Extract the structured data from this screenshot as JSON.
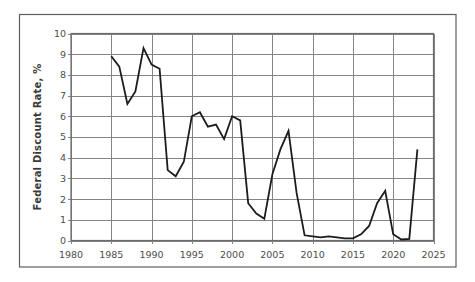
{
  "figure": {
    "background": "#ffffff",
    "outer_border_color": "#5f5f5f",
    "plot_border_color": "#6b6b6b"
  },
  "chart_data": {
    "type": "line",
    "title": "",
    "xlabel": "",
    "ylabel": "Federal Discount Rate, %",
    "xlim": [
      1980,
      2025
    ],
    "ylim": [
      0,
      10
    ],
    "x_ticks": [
      1980,
      1985,
      1990,
      1995,
      2000,
      2005,
      2010,
      2015,
      2020,
      2025
    ],
    "y_ticks": [
      0,
      1,
      2,
      3,
      4,
      5,
      6,
      7,
      8,
      9,
      10
    ],
    "grid": true,
    "legend_position": "none",
    "line_color": "#1c1c1c",
    "grid_color": "#858585",
    "tick_label_color": "#4d4d4d",
    "axis_title_color": "#3a3a3a",
    "series": [
      {
        "name": "Federal Discount Rate",
        "x": [
          1985,
          1986,
          1987,
          1988,
          1989,
          1990,
          1991,
          1992,
          1993,
          1994,
          1995,
          1996,
          1997,
          1998,
          1999,
          2000,
          2001,
          2002,
          2003,
          2004,
          2005,
          2006,
          2007,
          2008,
          2009,
          2010,
          2011,
          2012,
          2013,
          2014,
          2015,
          2016,
          2017,
          2018,
          2019,
          2020,
          2021,
          2022,
          2023
        ],
        "values": [
          8.9,
          8.4,
          6.6,
          7.2,
          9.3,
          8.5,
          8.3,
          3.4,
          3.1,
          3.8,
          6.0,
          6.2,
          5.5,
          5.6,
          4.9,
          6.0,
          5.8,
          1.8,
          1.3,
          1.05,
          3.2,
          4.4,
          5.3,
          2.3,
          0.25,
          0.2,
          0.15,
          0.2,
          0.15,
          0.1,
          0.1,
          0.3,
          0.7,
          1.8,
          2.4,
          0.3,
          0.05,
          0.08,
          4.4
        ]
      }
    ]
  }
}
